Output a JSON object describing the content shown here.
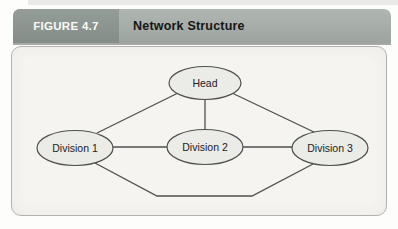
{
  "header": {
    "figure_label": "FIGURE 4.7",
    "title": "Network Structure"
  },
  "diagram": {
    "type": "network-organization-chart",
    "nodes": [
      {
        "id": "head",
        "label": "Head"
      },
      {
        "id": "division-1",
        "label": "Division 1"
      },
      {
        "id": "division-2",
        "label": "Division 2"
      },
      {
        "id": "division-3",
        "label": "Division 3"
      }
    ],
    "edges": [
      {
        "from": "Head",
        "to": "Division 1"
      },
      {
        "from": "Head",
        "to": "Division 2"
      },
      {
        "from": "Head",
        "to": "Division 3"
      },
      {
        "from": "Division 1",
        "to": "Division 2"
      },
      {
        "from": "Division 2",
        "to": "Division 3"
      },
      {
        "from": "Division 1",
        "to": "Division 3"
      }
    ]
  },
  "colors": {
    "header_left_bg": "#8d9591",
    "header_right_bg": "#a6ada9",
    "figure_label_text": "#fafaf8",
    "title_text": "#161616",
    "panel_bg": "#f5f4f1",
    "panel_border": "#b3b2af",
    "node_fill": "#ebebe8",
    "node_stroke": "#4f4f4f",
    "edge_stroke": "#4f4f4f"
  }
}
